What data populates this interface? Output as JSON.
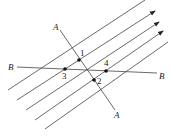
{
  "diagram": {
    "colors": {
      "line": "#444444",
      "point": "#111111",
      "background": "#ffffff"
    },
    "parallel_lines": [
      {
        "id": 1,
        "x1": 8,
        "y1": 90,
        "x2": 145,
        "y2": 0,
        "arrow": false
      },
      {
        "id": 2,
        "x1": 17,
        "y1": 100,
        "x2": 155,
        "y2": 11,
        "arrow": true
      },
      {
        "id": 3,
        "x1": 26,
        "y1": 110,
        "x2": 159,
        "y2": 22,
        "arrow": true
      },
      {
        "id": 4,
        "x1": 35,
        "y1": 120,
        "x2": 163,
        "y2": 31,
        "arrow": true
      },
      {
        "id": 5,
        "x1": 45,
        "y1": 129,
        "x2": 168,
        "y2": 42,
        "arrow": false
      }
    ],
    "line_a": {
      "label_start": "A",
      "label_end": "A",
      "x1": 60,
      "y1": 30,
      "x2": 115,
      "y2": 110
    },
    "line_b": {
      "label_start": "B",
      "label_end": "B",
      "x1": 17,
      "y1": 67,
      "x2": 157,
      "y2": 73
    },
    "points": [
      {
        "label": "1",
        "x": 79,
        "y": 60
      },
      {
        "label": "2",
        "x": 94,
        "y": 80
      },
      {
        "label": "3",
        "x": 65,
        "y": 69
      },
      {
        "label": "4",
        "x": 106,
        "y": 71
      }
    ]
  }
}
